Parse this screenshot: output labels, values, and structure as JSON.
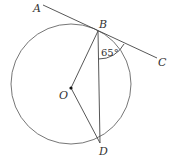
{
  "diagram": {
    "points": {
      "A": "A",
      "B": "B",
      "C": "C",
      "O": "O",
      "D": "D"
    },
    "angle_label": "65°",
    "angle_between": [
      "CB",
      "BD"
    ],
    "relationships": [
      "ABC is tangent to the circle at B",
      "O is the center of the circle",
      "BD is a chord",
      "OB and OD are radii",
      "angle CBD = 65°"
    ],
    "colors": {
      "stroke": "#555555",
      "text": "#333333",
      "background": "#ffffff"
    }
  }
}
